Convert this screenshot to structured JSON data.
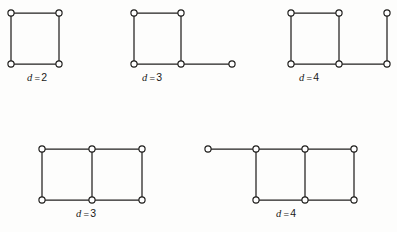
{
  "figure": {
    "kind": "graph-diagram-plate",
    "background_color": "#fdfdfc",
    "ink_color": "#22211f",
    "node_fill_color": "#ffffff",
    "width": 397,
    "height": 232,
    "node_radius": 3.1,
    "variable_symbol": "d",
    "equals_symbol": "=",
    "diagrams": [
      {
        "id": "fig-1",
        "label": {
          "var": "d",
          "eq": "=",
          "val": "2"
        },
        "label_x": 27,
        "label_y": 72,
        "nodes": [
          {
            "id": "n1",
            "x": 11,
            "y": 13
          },
          {
            "id": "n2",
            "x": 59,
            "y": 13
          },
          {
            "id": "n3",
            "x": 11,
            "y": 64
          },
          {
            "id": "n4",
            "x": 59,
            "y": 64
          }
        ],
        "edges": [
          {
            "from": "n1",
            "to": "n2"
          },
          {
            "from": "n2",
            "to": "n4"
          },
          {
            "from": "n4",
            "to": "n3"
          },
          {
            "from": "n3",
            "to": "n1"
          }
        ]
      },
      {
        "id": "fig-2",
        "label": {
          "var": "d",
          "eq": "=",
          "val": "3"
        },
        "label_x": 142,
        "label_y": 72,
        "nodes": [
          {
            "id": "n1",
            "x": 134,
            "y": 13
          },
          {
            "id": "n2",
            "x": 181,
            "y": 13
          },
          {
            "id": "n3",
            "x": 134,
            "y": 64
          },
          {
            "id": "n4",
            "x": 181,
            "y": 64
          },
          {
            "id": "n5",
            "x": 232,
            "y": 64
          }
        ],
        "edges": [
          {
            "from": "n1",
            "to": "n2"
          },
          {
            "from": "n2",
            "to": "n4"
          },
          {
            "from": "n4",
            "to": "n3"
          },
          {
            "from": "n3",
            "to": "n1"
          },
          {
            "from": "n4",
            "to": "n5"
          }
        ]
      },
      {
        "id": "fig-3",
        "label": {
          "var": "d",
          "eq": "=",
          "val": "4"
        },
        "label_x": 299,
        "label_y": 72,
        "nodes": [
          {
            "id": "n1",
            "x": 291,
            "y": 13
          },
          {
            "id": "n2",
            "x": 339,
            "y": 13
          },
          {
            "id": "n3",
            "x": 291,
            "y": 64
          },
          {
            "id": "n4",
            "x": 339,
            "y": 64
          },
          {
            "id": "n5",
            "x": 387,
            "y": 13
          },
          {
            "id": "n6",
            "x": 387,
            "y": 64
          }
        ],
        "edges": [
          {
            "from": "n1",
            "to": "n2"
          },
          {
            "from": "n2",
            "to": "n4"
          },
          {
            "from": "n4",
            "to": "n3"
          },
          {
            "from": "n3",
            "to": "n1"
          },
          {
            "from": "n4",
            "to": "n6"
          },
          {
            "from": "n6",
            "to": "n5"
          }
        ]
      },
      {
        "id": "fig-4",
        "label": {
          "var": "d",
          "eq": "=",
          "val": "3"
        },
        "label_x": 76,
        "label_y": 208,
        "nodes": [
          {
            "id": "n1",
            "x": 42,
            "y": 149
          },
          {
            "id": "n2",
            "x": 92,
            "y": 149
          },
          {
            "id": "n3",
            "x": 142,
            "y": 149
          },
          {
            "id": "n4",
            "x": 42,
            "y": 200
          },
          {
            "id": "n5",
            "x": 92,
            "y": 200
          },
          {
            "id": "n6",
            "x": 142,
            "y": 200
          }
        ],
        "edges": [
          {
            "from": "n1",
            "to": "n2"
          },
          {
            "from": "n2",
            "to": "n3"
          },
          {
            "from": "n4",
            "to": "n5"
          },
          {
            "from": "n5",
            "to": "n6"
          },
          {
            "from": "n1",
            "to": "n4"
          },
          {
            "from": "n2",
            "to": "n5"
          },
          {
            "from": "n3",
            "to": "n6"
          }
        ]
      },
      {
        "id": "fig-5",
        "label": {
          "var": "d",
          "eq": "=",
          "val": "4"
        },
        "label_x": 276,
        "label_y": 208,
        "nodes": [
          {
            "id": "n0",
            "x": 208,
            "y": 149
          },
          {
            "id": "n1",
            "x": 256,
            "y": 149
          },
          {
            "id": "n2",
            "x": 305,
            "y": 149
          },
          {
            "id": "n3",
            "x": 354,
            "y": 149
          },
          {
            "id": "n4",
            "x": 256,
            "y": 200
          },
          {
            "id": "n5",
            "x": 305,
            "y": 200
          },
          {
            "id": "n6",
            "x": 354,
            "y": 200
          }
        ],
        "edges": [
          {
            "from": "n0",
            "to": "n1"
          },
          {
            "from": "n1",
            "to": "n2"
          },
          {
            "from": "n2",
            "to": "n3"
          },
          {
            "from": "n4",
            "to": "n5"
          },
          {
            "from": "n5",
            "to": "n6"
          },
          {
            "from": "n1",
            "to": "n4"
          },
          {
            "from": "n2",
            "to": "n5"
          },
          {
            "from": "n3",
            "to": "n6"
          }
        ]
      }
    ]
  }
}
